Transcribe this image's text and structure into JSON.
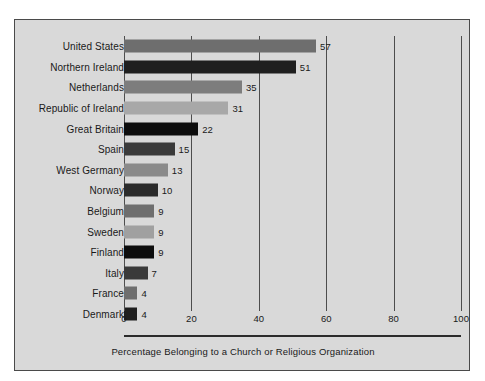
{
  "top_bleed_text": "·  ·  ·   ·    ·  ·",
  "caption": "Percentage Belonging to a Church or Religious Organization",
  "colors": {
    "panel_background": "#d9d9d9",
    "panel_border": "#4a4a4a",
    "gridline": "#4d4d4d",
    "axis_rule": "#2b2b2b",
    "text": "#1a1a1a"
  },
  "chart_data": {
    "type": "bar",
    "orientation": "horizontal",
    "title": "",
    "subtitle": "",
    "xlabel": "Percentage Belonging to a Church or Religious Organization",
    "ylabel": "",
    "xlim": [
      0,
      100
    ],
    "xticks": [
      0,
      20,
      40,
      60,
      80,
      100
    ],
    "xtick_labels": [
      "0",
      "20",
      "40",
      "60",
      "80",
      "100"
    ],
    "grid": true,
    "legend": false,
    "value_labels": true,
    "categories": [
      "United States",
      "Northern Ireland",
      "Netherlands",
      "Republic of Ireland",
      "Great Britain",
      "Spain",
      "West Germany",
      "Norway",
      "Belgium",
      "Sweden",
      "Finland",
      "Italy",
      "France",
      "Denmark"
    ],
    "values": [
      57,
      51,
      35,
      31,
      22,
      15,
      13,
      10,
      9,
      9,
      9,
      7,
      4,
      4
    ],
    "bars": [
      {
        "label": "United States",
        "value": 57,
        "value_text": "57",
        "color": "#6e6e6e"
      },
      {
        "label": "Northern Ireland",
        "value": 51,
        "value_text": "51",
        "color": "#1f1f1f"
      },
      {
        "label": "Netherlands",
        "value": 35,
        "value_text": "35",
        "color": "#7d7d7d"
      },
      {
        "label": "Republic of Ireland",
        "value": 31,
        "value_text": "31",
        "color": "#a8a8a8"
      },
      {
        "label": "Great Britain",
        "value": 22,
        "value_text": "22",
        "color": "#0d0d0d"
      },
      {
        "label": "Spain",
        "value": 15,
        "value_text": "15",
        "color": "#3a3a3a"
      },
      {
        "label": "West Germany",
        "value": 13,
        "value_text": "13",
        "color": "#8a8a8a"
      },
      {
        "label": "Norway",
        "value": 10,
        "value_text": "10",
        "color": "#2b2b2b"
      },
      {
        "label": "Belgium",
        "value": 9,
        "value_text": "9",
        "color": "#6e6e6e"
      },
      {
        "label": "Sweden",
        "value": 9,
        "value_text": "9",
        "color": "#a0a0a0"
      },
      {
        "label": "Finland",
        "value": 9,
        "value_text": "9",
        "color": "#0d0d0d"
      },
      {
        "label": "Italy",
        "value": 7,
        "value_text": "7",
        "color": "#3a3a3a"
      },
      {
        "label": "France",
        "value": 4,
        "value_text": "4",
        "color": "#6e6e6e"
      },
      {
        "label": "Denmark",
        "value": 4,
        "value_text": "4",
        "color": "#1f1f1f"
      }
    ]
  }
}
